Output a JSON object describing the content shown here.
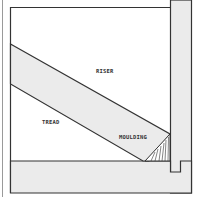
{
  "diagram": {
    "type": "cross-section",
    "labels": {
      "riser": "RISER",
      "tread": "TREAD",
      "moulding": "MOULDING"
    },
    "colors": {
      "fill": "#ebebeb",
      "stroke": "#333333",
      "background": "#ffffff"
    }
  }
}
